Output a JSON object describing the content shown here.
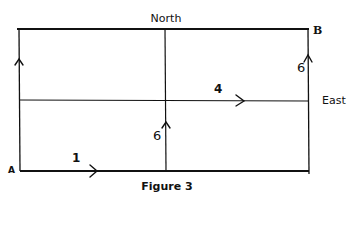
{
  "diagram": {
    "title": "Figure 3",
    "compass": {
      "north_label": "North",
      "east_label": "East"
    },
    "points": {
      "start": "A",
      "end": "B"
    },
    "segments": [
      {
        "label": "1",
        "direction": "east",
        "location": "bottom edge from A"
      },
      {
        "label": "6",
        "direction": "north",
        "location": "middle vertical line, lower half"
      },
      {
        "label": "4",
        "direction": "east",
        "location": "middle horizontal line, right half"
      },
      {
        "label": "6",
        "direction": "north",
        "location": "right edge, upper half toward B"
      }
    ],
    "colors": {
      "line": "#111111",
      "background": "#ffffff"
    }
  }
}
